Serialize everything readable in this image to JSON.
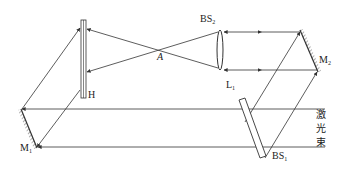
{
  "diagram": {
    "type": "holographic recording optical setup",
    "labels": {
      "hologram": "H",
      "focus_point": "A",
      "beam_splitter_2": "BS",
      "beam_splitter_2_sub": "2",
      "lens": "L",
      "lens_sub": "1",
      "mirror_2": "M",
      "mirror_2_sub": "2",
      "mirror_1": "M",
      "mirror_1_sub": "1",
      "beam_splitter_1": "BS",
      "beam_splitter_1_sub": "1",
      "laser_beam_1": "激",
      "laser_beam_2": "光",
      "laser_beam_3": "束"
    },
    "colors": {
      "line": "#333333",
      "background": "#ffffff"
    }
  }
}
